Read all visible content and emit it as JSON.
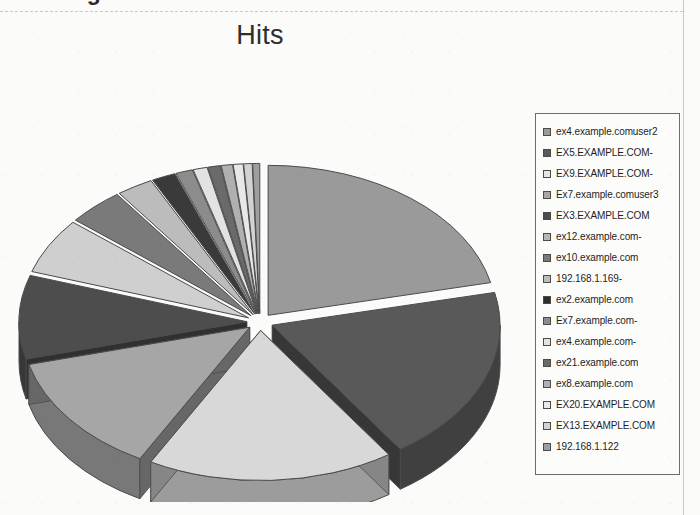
{
  "page": {
    "clipped_heading": "Creating a Pie Chart",
    "background_color": "#fbfbfa"
  },
  "chart_data": {
    "type": "pie",
    "title": "Hits",
    "exploded": true,
    "three_d": true,
    "legend_position": "right",
    "categories": [
      "ex4.example.comuser2",
      "EX5.EXAMPLE.COM-",
      "EX9.EXAMPLE.COM-",
      "Ex7.example.comuser3",
      "EX3.EXAMPLE.COM",
      "ex12.example.com-",
      "ex10.example.com",
      "192.168.1.169-",
      "ex2.example.com",
      "Ex7.example.com-",
      "ex4.example.com-",
      "ex21.example.com",
      "ex8.example.com",
      "EX20.EXAMPLE.COM",
      "EX13.EXAMPLE.COM",
      "192.168.1.122"
    ],
    "values": [
      21.5,
      19.0,
      17.5,
      13.0,
      9.0,
      6.0,
      4.0,
      2.6,
      1.7,
      1.2,
      1.0,
      0.9,
      0.8,
      0.7,
      0.6,
      0.5
    ],
    "colors": [
      "#9a9a9a",
      "#595959",
      "#d8d8d8",
      "#a6a6a6",
      "#4d4d4d",
      "#cfcfcf",
      "#7a7a7a",
      "#bcbcbc",
      "#3a3a3a",
      "#8c8c8c",
      "#e2e2e2",
      "#6a6a6a",
      "#b0b0b0",
      "#e8e8e8",
      "#d2d2d2",
      "#9e9e9e"
    ],
    "xlabel": "",
    "ylabel": ""
  },
  "legend": {
    "items": [
      {
        "label": "ex4.example.comuser2",
        "swatch": "#9a9a9a"
      },
      {
        "label": "EX5.EXAMPLE.COM-",
        "swatch": "#595959"
      },
      {
        "label": "EX9.EXAMPLE.COM-",
        "swatch": "#e4e4e4"
      },
      {
        "label": "Ex7.example.comuser3",
        "swatch": "#a6a6a6"
      },
      {
        "label": "EX3.EXAMPLE.COM",
        "swatch": "#4d4d4d"
      },
      {
        "label": "ex12.example.com-",
        "swatch": "#b7b7b7"
      },
      {
        "label": "ex10.example.com",
        "swatch": "#7a7a7a"
      },
      {
        "label": "192.168.1.169-",
        "swatch": "#bcbcbc"
      },
      {
        "label": "ex2.example.com",
        "swatch": "#2f2f2f"
      },
      {
        "label": "Ex7.example.com-",
        "swatch": "#8c8c8c"
      },
      {
        "label": "ex4.example.com-",
        "swatch": "#e2e2e2"
      },
      {
        "label": "ex21.example.com",
        "swatch": "#6a6a6a"
      },
      {
        "label": "ex8.example.com",
        "swatch": "#b0b0b0"
      },
      {
        "label": "EX20.EXAMPLE.COM",
        "swatch": "#e8e8e8"
      },
      {
        "label": "EX13.EXAMPLE.COM",
        "swatch": "#d2d2d2"
      },
      {
        "label": "192.168.1.122",
        "swatch": "#9e9e9e"
      }
    ]
  }
}
